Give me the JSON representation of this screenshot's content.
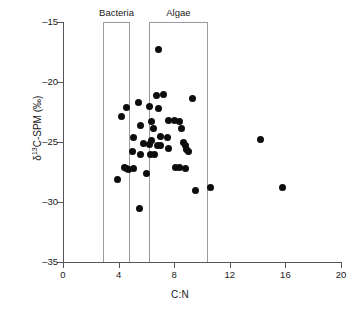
{
  "chart_data": {
    "type": "scatter",
    "title": "",
    "xlabel": "C:N",
    "ylabel": "δ¹³C-SPM (‰)",
    "ylabel_parts": {
      "prefix": "δ",
      "sup": "13",
      "suffix": "C-SPM (‰)"
    },
    "xlim": [
      0,
      20
    ],
    "ylim": [
      -35,
      -15
    ],
    "xticks": [
      0,
      4,
      8,
      12,
      16,
      20
    ],
    "xtick_labels": [
      "0",
      "4",
      "8",
      "12",
      "16",
      "20"
    ],
    "yticks": [
      -15,
      -20,
      -25,
      -30,
      -35
    ],
    "ytick_labels": [
      "–15",
      "–20",
      "–25",
      "–30",
      "–35"
    ],
    "grid": false,
    "legend": "none",
    "marker": {
      "shape": "circle",
      "color": "#0d0d0d",
      "size_px": 7
    },
    "annotations": [
      {
        "label": "Bacteria",
        "type": "range-box",
        "x_start": 2.9,
        "x_end": 4.8,
        "y_top": -15,
        "y_bottom": -35
      },
      {
        "label": "Algae",
        "type": "range-box",
        "x_start": 6.2,
        "x_end": 10.4,
        "y_top": -15,
        "y_bottom": -35
      }
    ],
    "points": [
      {
        "x": 6.9,
        "y": -17.3
      },
      {
        "x": 6.7,
        "y": -21.1
      },
      {
        "x": 7.2,
        "y": -21.0
      },
      {
        "x": 5.4,
        "y": -21.7
      },
      {
        "x": 9.3,
        "y": -21.4
      },
      {
        "x": 4.6,
        "y": -22.1
      },
      {
        "x": 6.2,
        "y": -22.0
      },
      {
        "x": 6.9,
        "y": -22.2
      },
      {
        "x": 4.2,
        "y": -22.9
      },
      {
        "x": 6.4,
        "y": -23.3
      },
      {
        "x": 7.6,
        "y": -23.2
      },
      {
        "x": 8.0,
        "y": -23.2
      },
      {
        "x": 8.4,
        "y": -23.3
      },
      {
        "x": 5.6,
        "y": -23.6
      },
      {
        "x": 6.5,
        "y": -23.9
      },
      {
        "x": 8.5,
        "y": -23.9
      },
      {
        "x": 5.1,
        "y": -24.6
      },
      {
        "x": 7.0,
        "y": -24.5
      },
      {
        "x": 7.5,
        "y": -24.6
      },
      {
        "x": 6.4,
        "y": -24.9
      },
      {
        "x": 5.8,
        "y": -25.1
      },
      {
        "x": 6.2,
        "y": -25.2
      },
      {
        "x": 6.8,
        "y": -25.3
      },
      {
        "x": 7.0,
        "y": -25.3
      },
      {
        "x": 8.7,
        "y": -25.0
      },
      {
        "x": 8.8,
        "y": -25.3
      },
      {
        "x": 8.9,
        "y": -25.6
      },
      {
        "x": 7.6,
        "y": -25.5
      },
      {
        "x": 5.0,
        "y": -25.8
      },
      {
        "x": 5.6,
        "y": -26.0
      },
      {
        "x": 6.3,
        "y": -26.0
      },
      {
        "x": 6.6,
        "y": -26.0
      },
      {
        "x": 9.0,
        "y": -25.8
      },
      {
        "x": 4.4,
        "y": -27.1
      },
      {
        "x": 4.6,
        "y": -27.2
      },
      {
        "x": 4.7,
        "y": -27.3
      },
      {
        "x": 5.1,
        "y": -27.2
      },
      {
        "x": 8.1,
        "y": -27.1
      },
      {
        "x": 8.4,
        "y": -27.1
      },
      {
        "x": 8.8,
        "y": -27.2
      },
      {
        "x": 6.0,
        "y": -27.6
      },
      {
        "x": 3.9,
        "y": -28.1
      },
      {
        "x": 9.5,
        "y": -29.0
      },
      {
        "x": 10.6,
        "y": -28.8
      },
      {
        "x": 14.2,
        "y": -24.8
      },
      {
        "x": 15.8,
        "y": -28.8
      },
      {
        "x": 5.5,
        "y": -30.5
      }
    ]
  }
}
